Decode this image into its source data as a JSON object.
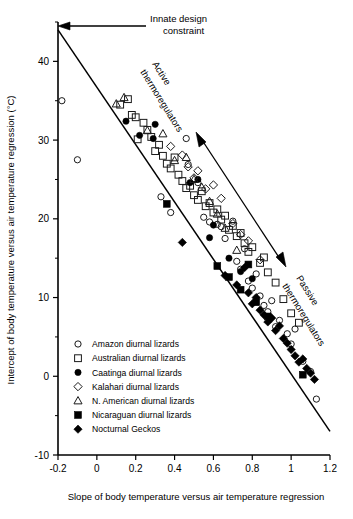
{
  "chart_data": {
    "type": "scatter",
    "title": "",
    "xlabel": "Slope of body temperature versus air temperature regression",
    "ylabel": "Intercept of body temperature versus air temperature regression (°C)",
    "xlim": [
      -0.2,
      1.2
    ],
    "ylim": [
      -10,
      45
    ],
    "xticks": [
      -0.2,
      0,
      0.2,
      0.4,
      0.6,
      0.8,
      1,
      1.2
    ],
    "xticklabels": [
      "-0.2",
      "0",
      "0.2",
      "0.4",
      "0.6",
      "0.8",
      "1",
      "1.2"
    ],
    "yticks": [
      -10,
      0,
      10,
      20,
      30,
      40
    ],
    "yticklabels": [
      "-10",
      "0",
      "10",
      "20",
      "30",
      "40"
    ],
    "y_minor_ticks": [
      -5,
      5,
      15,
      25,
      35,
      45
    ],
    "grid": false,
    "legend_position": "lower-left-inside",
    "trendline": {
      "x_start": -0.2,
      "y_start": 44.0,
      "x_end": 1.2,
      "y_end": -7.0
    },
    "annotations": [
      {
        "text": "Innate design constraint",
        "role": "callout-top-left"
      },
      {
        "text": "Active thermoregulators",
        "role": "rotated-upper-diagonal"
      },
      {
        "text": "Passive thermoregulators",
        "role": "rotated-lower-diagonal"
      }
    ],
    "series": [
      {
        "name": "Amazon diurnal lizards",
        "marker": "circle-open",
        "points": [
          [
            -0.18,
            35.0
          ],
          [
            -0.1,
            27.5
          ],
          [
            0.33,
            22.8
          ],
          [
            0.38,
            20.8
          ],
          [
            0.46,
            30.2
          ],
          [
            0.47,
            26.9
          ],
          [
            0.52,
            24.6
          ],
          [
            0.55,
            20.2
          ],
          [
            0.58,
            19.6
          ],
          [
            0.62,
            19.3
          ],
          [
            0.64,
            19.0
          ],
          [
            0.66,
            17.5
          ],
          [
            0.7,
            19.7
          ],
          [
            0.72,
            14.6
          ],
          [
            0.74,
            13.6
          ],
          [
            0.76,
            16.2
          ],
          [
            0.78,
            12.1
          ],
          [
            0.8,
            11.2
          ],
          [
            0.82,
            13.0
          ],
          [
            0.84,
            10.2
          ],
          [
            0.86,
            9.0
          ],
          [
            0.88,
            8.2
          ],
          [
            0.9,
            9.6
          ],
          [
            0.92,
            6.3
          ],
          [
            0.94,
            7.1
          ],
          [
            0.98,
            5.4
          ],
          [
            1.0,
            4.1
          ],
          [
            1.02,
            6.0
          ],
          [
            1.06,
            1.9
          ],
          [
            1.1,
            0.6
          ],
          [
            1.13,
            -2.9
          ]
        ]
      },
      {
        "name": "Australian diurnal lizards",
        "marker": "square-open",
        "points": [
          [
            0.12,
            34.5
          ],
          [
            0.16,
            35.2
          ],
          [
            0.18,
            33.2
          ],
          [
            0.2,
            32.9
          ],
          [
            0.21,
            30.1
          ],
          [
            0.24,
            32.2
          ],
          [
            0.26,
            31.3
          ],
          [
            0.28,
            30.4
          ],
          [
            0.3,
            28.6
          ],
          [
            0.32,
            29.4
          ],
          [
            0.34,
            28.0
          ],
          [
            0.36,
            27.0
          ],
          [
            0.38,
            26.4
          ],
          [
            0.4,
            27.8
          ],
          [
            0.42,
            25.6
          ],
          [
            0.44,
            24.8
          ],
          [
            0.46,
            23.9
          ],
          [
            0.48,
            24.2
          ],
          [
            0.5,
            23.0
          ],
          [
            0.52,
            22.4
          ],
          [
            0.54,
            23.5
          ],
          [
            0.56,
            21.6
          ],
          [
            0.58,
            22.0
          ],
          [
            0.6,
            20.8
          ],
          [
            0.62,
            21.2
          ],
          [
            0.64,
            19.9
          ],
          [
            0.66,
            20.4
          ],
          [
            0.68,
            18.6
          ],
          [
            0.7,
            19.1
          ],
          [
            0.72,
            17.8
          ],
          [
            0.74,
            18.2
          ],
          [
            0.76,
            16.9
          ],
          [
            0.78,
            15.8
          ],
          [
            0.8,
            16.4
          ],
          [
            0.84,
            14.4
          ],
          [
            0.86,
            15.1
          ],
          [
            0.88,
            13.2
          ],
          [
            0.92,
            11.9
          ],
          [
            0.96,
            9.8
          ],
          [
            1.0,
            8.0
          ],
          [
            1.04,
            6.8
          ]
        ]
      },
      {
        "name": "Caatinga diurnal lizards",
        "marker": "circle-filled",
        "points": [
          [
            0.15,
            32.4
          ],
          [
            0.22,
            30.6
          ],
          [
            0.3,
            32.0
          ],
          [
            0.29,
            30.2
          ],
          [
            0.48,
            24.6
          ],
          [
            0.52,
            25.0
          ],
          [
            0.6,
            19.2
          ],
          [
            0.58,
            17.6
          ],
          [
            0.68,
            15.0
          ],
          [
            0.74,
            13.3
          ],
          [
            0.8,
            12.4
          ]
        ]
      },
      {
        "name": "Kalahari diurnal lizards",
        "marker": "diamond-open",
        "points": [
          [
            0.38,
            29.2
          ],
          [
            0.44,
            28.1
          ],
          [
            0.47,
            26.6
          ],
          [
            0.5,
            25.2
          ],
          [
            0.52,
            26.1
          ],
          [
            0.56,
            23.8
          ],
          [
            0.6,
            24.3
          ],
          [
            0.64,
            22.6
          ],
          [
            0.7,
            19.4
          ],
          [
            0.74,
            18.0
          ],
          [
            0.78,
            17.2
          ],
          [
            0.84,
            14.8
          ]
        ]
      },
      {
        "name": "N. American diurnal lizards",
        "marker": "triangle-open",
        "points": [
          [
            0.1,
            34.6
          ],
          [
            0.14,
            35.4
          ],
          [
            0.26,
            31.2
          ],
          [
            0.34,
            30.8
          ],
          [
            0.4,
            27.4
          ],
          [
            0.46,
            27.8
          ],
          [
            0.5,
            25.0
          ],
          [
            0.54,
            24.0
          ],
          [
            0.58,
            22.2
          ],
          [
            0.62,
            20.6
          ],
          [
            0.66,
            18.8
          ],
          [
            0.72,
            16.0
          ]
        ]
      },
      {
        "name": "Nicaraguan diurnal lizards",
        "marker": "square-filled",
        "points": [
          [
            0.36,
            21.9
          ],
          [
            0.62,
            14.0
          ],
          [
            0.68,
            12.6
          ],
          [
            0.74,
            11.0
          ],
          [
            0.78,
            14.2
          ],
          [
            0.82,
            9.4
          ],
          [
            0.88,
            7.6
          ],
          [
            1.06,
            0.2
          ]
        ]
      },
      {
        "name": "Nocturnal Geckos",
        "marker": "diamond-filled",
        "points": [
          [
            0.44,
            17.0
          ],
          [
            0.66,
            12.8
          ],
          [
            0.72,
            11.6
          ],
          [
            0.76,
            13.8
          ],
          [
            0.78,
            10.6
          ],
          [
            0.8,
            9.2
          ],
          [
            0.82,
            10.0
          ],
          [
            0.84,
            8.4
          ],
          [
            0.86,
            7.8
          ],
          [
            0.88,
            6.9
          ],
          [
            0.9,
            7.4
          ],
          [
            0.92,
            5.8
          ],
          [
            0.94,
            6.4
          ],
          [
            0.96,
            4.8
          ],
          [
            0.98,
            4.2
          ],
          [
            1.0,
            3.4
          ],
          [
            1.02,
            2.6
          ],
          [
            1.04,
            1.8
          ],
          [
            1.06,
            2.2
          ],
          [
            1.08,
            1.0
          ],
          [
            1.1,
            0.4
          ],
          [
            1.12,
            -0.4
          ]
        ]
      }
    ]
  },
  "legend": {
    "items": [
      {
        "label": "Amazon diurnal lizards",
        "marker": "circle-open"
      },
      {
        "label": "Australian diurnal lizards",
        "marker": "square-open"
      },
      {
        "label": "Caatinga diurnal lizards",
        "marker": "circle-filled"
      },
      {
        "label": "Kalahari diurnal lizards",
        "marker": "diamond-open"
      },
      {
        "label": "N. American diurnal lizards",
        "marker": "triangle-open"
      },
      {
        "label": "Nicaraguan diurnal lizards",
        "marker": "square-filled"
      },
      {
        "label": "Nocturnal Geckos",
        "marker": "diamond-filled"
      }
    ]
  },
  "annotations": {
    "innate_line1": "Innate design",
    "innate_line2": "constraint",
    "active_line1": "Active",
    "active_line2": "thermoregulators",
    "passive_line1": "Passive",
    "passive_line2": "thermoregulators"
  },
  "colors": {
    "axis": "#000000",
    "marker_fill": "#000000",
    "marker_stroke": "#1a1a1a",
    "background": "#ffffff"
  }
}
